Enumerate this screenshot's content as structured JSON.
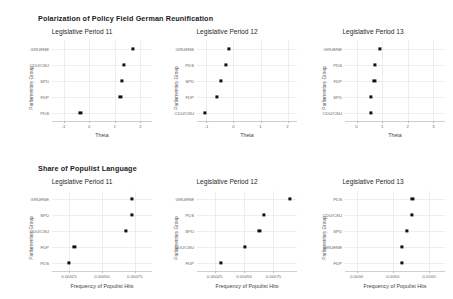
{
  "figure": {
    "width": 453,
    "height": 299,
    "background": "#ffffff",
    "dot_color": "#111111",
    "grid_color": "#ededed"
  },
  "sections": [
    {
      "id": "polarization",
      "title": "Polarization of Policy Field German Reunification",
      "xlabel": "Theta",
      "ylabel": "Parliamentary Group",
      "panels": [
        {
          "title": "Legislative Period 11",
          "xlabel": "Theta",
          "ylabel": "Parliamentary Group",
          "xticks": [
            "-1",
            "0",
            "1",
            "2"
          ],
          "xtickvals": [
            -1,
            0,
            1,
            2
          ],
          "xlim": [
            -1.45,
            2.45
          ],
          "categories": [
            "GRUENE",
            "CDU/CSU",
            "SPD",
            "FDP",
            "PDS"
          ],
          "values": [
            1.72,
            1.35,
            1.28,
            1.22,
            -0.34
          ]
        },
        {
          "title": "Legislative Period 12",
          "xlabel": "Theta",
          "ylabel": "Parliamentary Group",
          "xticks": [
            "-1",
            "0",
            "1",
            "2"
          ],
          "xtickvals": [
            -1,
            0,
            1,
            2
          ],
          "xlim": [
            -1.35,
            2.35
          ],
          "categories": [
            "GRUENE",
            "PDS",
            "SPD",
            "FDP",
            "CDU/CSU"
          ],
          "values": [
            -0.18,
            -0.28,
            -0.46,
            -0.62,
            -1.05
          ]
        },
        {
          "title": "Legislative Period 13",
          "xlabel": "Theta",
          "ylabel": "Parliamentary Group",
          "xticks": [
            "0",
            "1",
            "2",
            "3"
          ],
          "xtickvals": [
            0,
            1,
            2,
            3
          ],
          "xlim": [
            -0.45,
            3.45
          ],
          "categories": [
            "GRUENE",
            "PDS",
            "FDP",
            "SPD",
            "CDU/CSU"
          ],
          "values": [
            0.92,
            0.72,
            0.7,
            0.55,
            0.55
          ]
        }
      ]
    },
    {
      "id": "populist",
      "title": "Share of Populist Language",
      "xlabel": "Frequency of Populist Hits",
      "ylabel": "Parliamentary Group",
      "panels": [
        {
          "title": "Legislative Period 11",
          "xlabel": "Frequency of Populist Hits",
          "ylabel": "Parliamentary Group",
          "xticks": [
            "0.00025",
            "0.00050",
            "0.00075"
          ],
          "xtickvals": [
            0.00025,
            0.0005,
            0.00075
          ],
          "xlim": [
            0.00012,
            0.00088
          ],
          "categories": [
            "GRUENE",
            "SPD",
            "CDU/CSU",
            "FDP",
            "PDS"
          ],
          "values": [
            0.00073,
            0.00073,
            0.00068,
            0.00029,
            0.00025
          ]
        },
        {
          "title": "Legislative Period 12",
          "xlabel": "Frequency of Populist Hits",
          "ylabel": "Parliamentary Group",
          "xticks": [
            "0.00025",
            "0.00050",
            "0.00075"
          ],
          "xtickvals": [
            0.00025,
            0.0005,
            0.00075
          ],
          "xlim": [
            0.0001,
            0.00095
          ],
          "categories": [
            "GRUENE",
            "PDS",
            "SPD",
            "CDU/CSU",
            "FDP"
          ],
          "values": [
            0.00089,
            0.00067,
            0.00063,
            0.00051,
            0.0003
          ]
        },
        {
          "title": "Legislative Period 13",
          "xlabel": "Frequency of Populist Hits",
          "ylabel": "Parliamentary Group",
          "xticks": [
            "0.0000",
            "0.0050",
            "0.0100"
          ],
          "xtickvals": [
            0.0,
            0.005,
            0.01
          ],
          "xlim": [
            -0.0016,
            0.0122
          ],
          "categories": [
            "PDS",
            "CDU/CSU",
            "SPD",
            "GRUENE",
            "FDP"
          ],
          "values": [
            0.0077,
            0.0076,
            0.0069,
            0.0063,
            0.0063
          ]
        }
      ]
    }
  ],
  "chart_data": {
    "type": "scatter",
    "layout": "2 rows x 3 columns of dot plots (Cleveland dot charts)",
    "legend": "none",
    "grid": true,
    "charts": [
      {
        "type": "scatter",
        "title": "Legislative Period 11",
        "section": "Polarization of Policy Field German Reunification",
        "xlabel": "Theta",
        "ylabel": "Parliamentary Group",
        "categories": [
          "GRUENE",
          "CDU/CSU",
          "SPD",
          "FDP",
          "PDS"
        ],
        "values": [
          1.72,
          1.35,
          1.28,
          1.22,
          -0.34
        ],
        "xlim": [
          -1.45,
          2.45
        ],
        "xticks": [
          -1,
          0,
          1,
          2
        ]
      },
      {
        "type": "scatter",
        "title": "Legislative Period 12",
        "section": "Polarization of Policy Field German Reunification",
        "xlabel": "Theta",
        "ylabel": "Parliamentary Group",
        "categories": [
          "GRUENE",
          "PDS",
          "SPD",
          "FDP",
          "CDU/CSU"
        ],
        "values": [
          -0.18,
          -0.28,
          -0.46,
          -0.62,
          -1.05
        ],
        "xlim": [
          -1.35,
          2.35
        ],
        "xticks": [
          -1,
          0,
          1,
          2
        ]
      },
      {
        "type": "scatter",
        "title": "Legislative Period 13",
        "section": "Polarization of Policy Field German Reunification",
        "xlabel": "Theta",
        "ylabel": "Parliamentary Group",
        "categories": [
          "GRUENE",
          "PDS",
          "FDP",
          "SPD",
          "CDU/CSU"
        ],
        "values": [
          0.92,
          0.72,
          0.7,
          0.55,
          0.55
        ],
        "xlim": [
          -0.45,
          3.45
        ],
        "xticks": [
          0,
          1,
          2,
          3
        ]
      },
      {
        "type": "scatter",
        "title": "Legislative Period 11",
        "section": "Share of Populist Language",
        "xlabel": "Frequency of Populist Hits",
        "ylabel": "Parliamentary Group",
        "categories": [
          "GRUENE",
          "SPD",
          "CDU/CSU",
          "FDP",
          "PDS"
        ],
        "values": [
          0.00073,
          0.00073,
          0.00068,
          0.00029,
          0.00025
        ],
        "xlim": [
          0.00012,
          0.00088
        ],
        "xticks": [
          0.00025,
          0.0005,
          0.00075
        ]
      },
      {
        "type": "scatter",
        "title": "Legislative Period 12",
        "section": "Share of Populist Language",
        "xlabel": "Frequency of Populist Hits",
        "ylabel": "Parliamentary Group",
        "categories": [
          "GRUENE",
          "PDS",
          "SPD",
          "CDU/CSU",
          "FDP"
        ],
        "values": [
          0.00089,
          0.00067,
          0.00063,
          0.00051,
          0.0003
        ],
        "xlim": [
          0.0001,
          0.00095
        ],
        "xticks": [
          0.00025,
          0.0005,
          0.00075
        ]
      },
      {
        "type": "scatter",
        "title": "Legislative Period 13",
        "section": "Share of Populist Language",
        "xlabel": "Frequency of Populist Hits",
        "ylabel": "Parliamentary Group",
        "categories": [
          "PDS",
          "CDU/CSU",
          "SPD",
          "GRUENE",
          "FDP"
        ],
        "values": [
          0.0077,
          0.0076,
          0.0069,
          0.0063,
          0.0063
        ],
        "xlim": [
          -0.0016,
          0.0122
        ],
        "xticks": [
          0.0,
          0.005,
          0.01
        ]
      }
    ]
  }
}
